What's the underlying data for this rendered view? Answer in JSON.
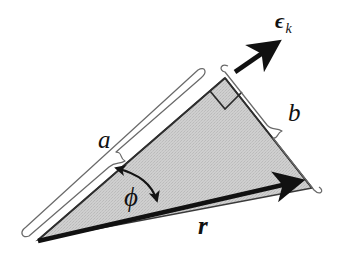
{
  "figure": {
    "canvas": {
      "width": 340,
      "height": 258,
      "background": "#ffffff"
    },
    "geometry": {
      "triangle_vertices": [
        {
          "name": "left-vertex",
          "x": 38,
          "y": 240
        },
        {
          "name": "apex-vertex",
          "x": 225,
          "y": 78
        },
        {
          "name": "right-vertex",
          "x": 312,
          "y": 188
        }
      ],
      "right_angle_at": "apex-vertex",
      "fill_color": "#c9c9c9",
      "outline_color": "#2b2b2b",
      "vector_r_color": "#111111",
      "vector_epsilon_color": "#111111",
      "brace_color": "#555555"
    },
    "labels": {
      "side_a": "a",
      "side_b": "b",
      "vector_r": "r",
      "angle_phi": "ϕ",
      "epsilon_base": "ϵ",
      "epsilon_subscript": "k"
    },
    "icons": {
      "right_angle_marker": "right-angle-square-icon",
      "arrow_r": "arrowhead-icon",
      "arrow_epsilon": "arrowhead-icon",
      "angle_arc": "double-headed-arc-arrow-icon",
      "brace_a": "curly-brace-icon",
      "brace_b": "curly-brace-icon"
    }
  }
}
